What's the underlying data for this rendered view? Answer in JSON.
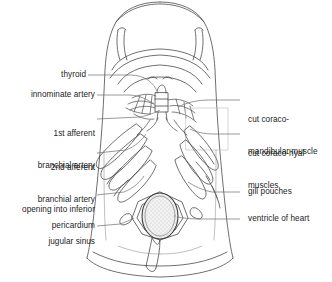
{
  "figure": {
    "type": "anatomical-line-drawing",
    "line_color": "#4a4a4a",
    "stipple_color": "#9a9a9a",
    "background": "#ffffff"
  },
  "labels_left": [
    {
      "id": "thyroid",
      "text": "thyroid"
    },
    {
      "id": "innominate-artery",
      "text": "innominate artery"
    },
    {
      "id": "first-afferent-branchial-artery",
      "line1": "1st afferent",
      "line2": "branchial artery"
    },
    {
      "id": "second-afferent-branchial-artery",
      "line1": "2nd afferent",
      "line2": "branchial artery"
    },
    {
      "id": "opening-into-inferior-jugular-sinus",
      "line1": "opening into inferior",
      "line2": "jugular sinus"
    },
    {
      "id": "pericardium",
      "text": "pericardium"
    }
  ],
  "labels_right": [
    {
      "id": "cut-coraco-mandibular-muscle",
      "line1": "cut coraco-",
      "line2": "mandibular muscle"
    },
    {
      "id": "cut-coraco-hyal-muscles",
      "line1": "cut coraco-hyal",
      "line2": "muscles"
    },
    {
      "id": "gill-pouches",
      "text": "gill pouches"
    },
    {
      "id": "ventricle-of-heart",
      "text": "ventricle of heart"
    }
  ]
}
